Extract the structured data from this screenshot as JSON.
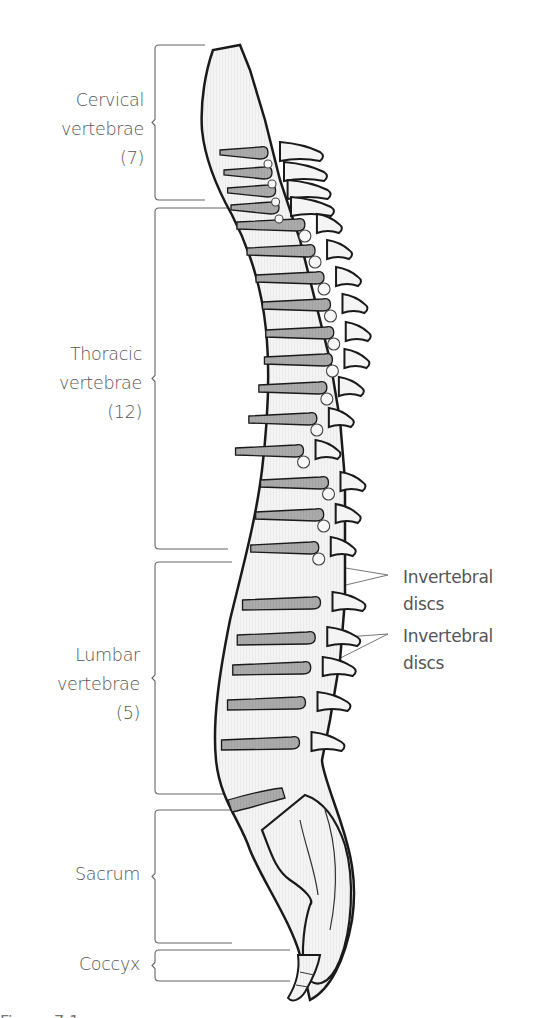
{
  "diagram": {
    "type": "anatomical-illustration",
    "colors": {
      "outline": "#1a1a1a",
      "bone_fill": "#f2f2f2",
      "disc_fill": "#a8a8a8",
      "label_text": "#555555",
      "bracket_line": "#666666",
      "leader_line": "#777777"
    },
    "regions": [
      {
        "id": "cervical",
        "lines": [
          "Cervical",
          "vertebrae",
          "(7)"
        ],
        "count": 7,
        "bracket_top": 45,
        "bracket_bottom": 200,
        "label_top": 86,
        "label_right": 144
      },
      {
        "id": "thoracic",
        "lines": [
          "Thoracic",
          "vertebrae",
          "(12)"
        ],
        "count": 12,
        "bracket_top": 208,
        "bracket_bottom": 549,
        "label_top": 340,
        "label_right": 142
      },
      {
        "id": "lumbar",
        "lines": [
          "Lumbar",
          "vertebrae",
          "(5)"
        ],
        "count": 5,
        "bracket_top": 562,
        "bracket_bottom": 794,
        "label_top": 641,
        "label_right": 140
      },
      {
        "id": "sacrum",
        "lines": [
          "Sacrum"
        ],
        "bracket_top": 810,
        "bracket_bottom": 943,
        "label_top": 860,
        "label_right": 140
      },
      {
        "id": "coccyx",
        "lines": [
          "Coccyx"
        ],
        "bracket_top": 950,
        "bracket_bottom": 981,
        "label_top": 950,
        "label_right": 140
      }
    ],
    "callouts": [
      {
        "id": "discs-upper",
        "lines": [
          "Invertebral",
          "discs"
        ],
        "label_top": 566,
        "anchor": [
          388,
          575
        ],
        "targets": [
          [
            285,
            558
          ],
          [
            295,
            597
          ]
        ]
      },
      {
        "id": "discs-lower",
        "lines": [
          "Invertebral",
          "discs"
        ],
        "label_top": 625,
        "anchor": [
          388,
          634
        ],
        "targets": [
          [
            290,
            641
          ],
          [
            285,
            686
          ]
        ]
      }
    ],
    "caption_fragment": "Figure 7.1"
  }
}
